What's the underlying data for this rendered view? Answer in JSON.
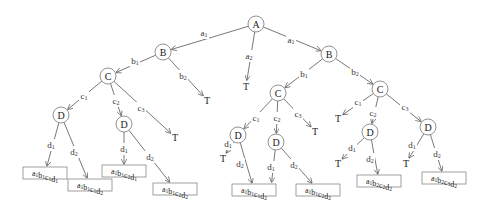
{
  "diagram": {
    "type": "decision-tree",
    "colors": {
      "edge": "#555555",
      "node_stroke": "#777777",
      "box_stroke": "#888888",
      "text": "#222222"
    },
    "nodes": [
      {
        "id": "A",
        "label": "A",
        "x": 256,
        "y": 24
      },
      {
        "id": "B1",
        "label": "B",
        "x": 163,
        "y": 52
      },
      {
        "id": "B2",
        "label": "B",
        "x": 329,
        "y": 54
      },
      {
        "id": "C1",
        "label": "C",
        "x": 108,
        "y": 76
      },
      {
        "id": "C2",
        "label": "C",
        "x": 278,
        "y": 93
      },
      {
        "id": "C3",
        "label": "C",
        "x": 380,
        "y": 89
      },
      {
        "id": "D1",
        "label": "D",
        "x": 61,
        "y": 115
      },
      {
        "id": "D2",
        "label": "D",
        "x": 124,
        "y": 124
      },
      {
        "id": "D3",
        "label": "D",
        "x": 238,
        "y": 135
      },
      {
        "id": "D4",
        "label": "D",
        "x": 276,
        "y": 142
      },
      {
        "id": "D5",
        "label": "D",
        "x": 370,
        "y": 132
      },
      {
        "id": "D6",
        "label": "D",
        "x": 428,
        "y": 127
      }
    ],
    "terminals": [
      {
        "id": "T1",
        "label": "T",
        "x": 246,
        "y": 86
      },
      {
        "id": "T2",
        "label": "T",
        "x": 207,
        "y": 100
      },
      {
        "id": "T3",
        "label": "T",
        "x": 175,
        "y": 137
      },
      {
        "id": "T4",
        "label": "T",
        "x": 315,
        "y": 131
      },
      {
        "id": "T5",
        "label": "T",
        "x": 338,
        "y": 118
      },
      {
        "id": "T6",
        "label": "T",
        "x": 223,
        "y": 158
      },
      {
        "id": "T7",
        "label": "T",
        "x": 271,
        "y": 188
      },
      {
        "id": "T8",
        "label": "T",
        "x": 338,
        "y": 163
      },
      {
        "id": "T9",
        "label": "T",
        "x": 406,
        "y": 163
      }
    ],
    "leaves": [
      {
        "id": "L1",
        "base": "a",
        "parts": [
          [
            "a",
            "1"
          ],
          [
            "b",
            "1"
          ],
          [
            "c",
            "1"
          ],
          [
            "d",
            "1"
          ]
        ],
        "text": "a1b1c1d1",
        "x": 45,
        "y": 173
      },
      {
        "id": "L2",
        "parts": [
          [
            "a",
            "1"
          ],
          [
            "b",
            "1"
          ],
          [
            "c",
            "1"
          ],
          [
            "d",
            "2"
          ]
        ],
        "text": "a1b1c1d2",
        "x": 90,
        "y": 185
      },
      {
        "id": "L3",
        "parts": [
          [
            "a",
            "1"
          ],
          [
            "b",
            "1"
          ],
          [
            "c",
            "2"
          ],
          [
            "d",
            "1"
          ]
        ],
        "text": "a1b1c2d1",
        "x": 124,
        "y": 171
      },
      {
        "id": "L4",
        "parts": [
          [
            "a",
            "1"
          ],
          [
            "b",
            "1"
          ],
          [
            "c",
            "2"
          ],
          [
            "d",
            "2"
          ]
        ],
        "text": "a1b1c2d2",
        "x": 175,
        "y": 189
      },
      {
        "id": "L5",
        "parts": [
          [
            "a",
            "1"
          ],
          [
            "b",
            "1"
          ],
          [
            "c",
            "1"
          ],
          [
            "d",
            "2"
          ]
        ],
        "text": "a1b1c1d2",
        "x": 254,
        "y": 190
      },
      {
        "id": "L6",
        "parts": [
          [
            "a",
            "1"
          ],
          [
            "b",
            "1"
          ],
          [
            "c",
            "2"
          ],
          [
            "d",
            "2"
          ]
        ],
        "text": "a1b1c2d2",
        "x": 318,
        "y": 190
      },
      {
        "id": "L7",
        "parts": [
          [
            "a",
            "1"
          ],
          [
            "b",
            "2"
          ],
          [
            "c",
            "2"
          ],
          [
            "d",
            "2"
          ]
        ],
        "text": "a1b2c2d2",
        "x": 379,
        "y": 181
      },
      {
        "id": "L8",
        "parts": [
          [
            "a",
            "1"
          ],
          [
            "b",
            "2"
          ],
          [
            "c",
            "3"
          ],
          [
            "d",
            "2"
          ]
        ],
        "text": "a1b2c3d2",
        "x": 444,
        "y": 178
      }
    ],
    "edges": [
      {
        "from": "A",
        "to": "B1",
        "label": [
          "a",
          "1"
        ],
        "lx": 204,
        "ly": 33
      },
      {
        "from": "A",
        "to": "T1",
        "label": [
          "a",
          "2"
        ],
        "lx": 249,
        "ly": 56
      },
      {
        "from": "A",
        "to": "B2",
        "label": [
          "a",
          "1"
        ],
        "lx": 291,
        "ly": 40
      },
      {
        "from": "B1",
        "to": "C1",
        "label": [
          "b",
          "1"
        ],
        "lx": 135,
        "ly": 61
      },
      {
        "from": "B1",
        "to": "T2",
        "label": [
          "b",
          "2"
        ],
        "lx": 183,
        "ly": 76
      },
      {
        "from": "C1",
        "to": "D1",
        "label": [
          "c",
          "1"
        ],
        "lx": 84,
        "ly": 96
      },
      {
        "from": "C1",
        "to": "D2",
        "label": [
          "c",
          "2"
        ],
        "lx": 116,
        "ly": 101
      },
      {
        "from": "C1",
        "to": "T3",
        "label": [
          "c",
          "3"
        ],
        "lx": 141,
        "ly": 108
      },
      {
        "from": "D1",
        "to": "L1",
        "label": [
          "d",
          "1"
        ],
        "lx": 51,
        "ly": 145
      },
      {
        "from": "D1",
        "to": "L2",
        "label": [
          "d",
          "2"
        ],
        "lx": 74,
        "ly": 152
      },
      {
        "from": "D2",
        "to": "L3",
        "label": [
          "d",
          "1"
        ],
        "lx": 124,
        "ly": 149
      },
      {
        "from": "D2",
        "to": "L4",
        "label": [
          "d",
          "2"
        ],
        "lx": 150,
        "ly": 157
      },
      {
        "from": "B2",
        "to": "C2",
        "label": [
          "b",
          "1"
        ],
        "lx": 304,
        "ly": 74
      },
      {
        "from": "B2",
        "to": "C3",
        "label": [
          "b",
          "2"
        ],
        "lx": 355,
        "ly": 72
      },
      {
        "from": "C2",
        "to": "D3",
        "label": [
          "c",
          "1"
        ],
        "lx": 256,
        "ly": 118
      },
      {
        "from": "C2",
        "to": "D4",
        "label": [
          "c",
          "2"
        ],
        "lx": 277,
        "ly": 118
      },
      {
        "from": "C2",
        "to": "T4",
        "label": [
          "c",
          "3"
        ],
        "lx": 298,
        "ly": 114
      },
      {
        "from": "D3",
        "to": "T6",
        "label": [
          "d",
          "1"
        ],
        "lx": 228,
        "ly": 144
      },
      {
        "from": "D3",
        "to": "L5",
        "label": [
          "d",
          "2"
        ],
        "lx": 240,
        "ly": 164
      },
      {
        "from": "D4",
        "to": "T7",
        "label": [
          "d",
          "1"
        ],
        "lx": 271,
        "ly": 167
      },
      {
        "from": "D4",
        "to": "L6",
        "label": [
          "d",
          "2"
        ],
        "lx": 294,
        "ly": 165
      },
      {
        "from": "C3",
        "to": "T5",
        "label": [
          "c",
          "1"
        ],
        "lx": 358,
        "ly": 102
      },
      {
        "from": "C3",
        "to": "D5",
        "label": [
          "c",
          "2"
        ],
        "lx": 373,
        "ly": 113
      },
      {
        "from": "C3",
        "to": "D6",
        "label": [
          "c",
          "3"
        ],
        "lx": 405,
        "ly": 107
      },
      {
        "from": "D5",
        "to": "T8",
        "label": [
          "d",
          "1"
        ],
        "lx": 352,
        "ly": 148
      },
      {
        "from": "D5",
        "to": "L7",
        "label": [
          "d",
          "2"
        ],
        "lx": 370,
        "ly": 159
      },
      {
        "from": "D6",
        "to": "T9",
        "label": [
          "d",
          "1"
        ],
        "lx": 412,
        "ly": 145
      },
      {
        "from": "D6",
        "to": "L8",
        "label": [
          "d",
          "2"
        ],
        "lx": 437,
        "ly": 154
      }
    ]
  }
}
